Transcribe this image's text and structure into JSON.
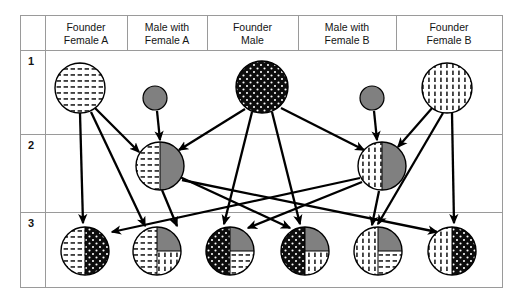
{
  "figure": {
    "type": "pedigree-breeding-diagram",
    "title": "",
    "generation_label_column_header": "",
    "column_headers": [
      {
        "id": "founder-female-a",
        "line1": "Founder",
        "line2": "Female A"
      },
      {
        "id": "male-with-female-a",
        "line1": "Male with",
        "line2": "Female A"
      },
      {
        "id": "founder-male",
        "line1": "Founder",
        "line2": "Male"
      },
      {
        "id": "male-with-female-b",
        "line1": "Male with",
        "line2": "Female B"
      },
      {
        "id": "founder-female-b",
        "line1": "Founder",
        "line2": "Female B"
      }
    ],
    "generation_labels": [
      "1",
      "2",
      "3"
    ],
    "colors": {
      "gray_fill": "#808080",
      "black_fill": "#0d0d0d",
      "white_fill": "#ffffff",
      "outline": "#000000",
      "grid": "#9a9a9a",
      "text": "#141414"
    },
    "pattern_legend": [
      {
        "id": "horizontal-dash",
        "meaning": "Founder Female A genome"
      },
      {
        "id": "vertical-dash",
        "meaning": "Founder Female B genome"
      },
      {
        "id": "black-dotted",
        "meaning": "Founder Male genome"
      },
      {
        "id": "solid-gray",
        "meaning": "Unrelated male genome"
      }
    ],
    "individuals": {
      "generation1": [
        {
          "id": "founder-female-a",
          "cx": 80,
          "cy": 88,
          "r": 25,
          "shape": "circle",
          "segments": [
            {
              "part": "full",
              "fill": "horizontal-dash"
            }
          ]
        },
        {
          "id": "male-with-female-a",
          "cx": 155,
          "cy": 98,
          "r": 12,
          "shape": "circle",
          "segments": [
            {
              "part": "full",
              "fill": "solid-gray"
            }
          ]
        },
        {
          "id": "founder-male",
          "cx": 262,
          "cy": 87,
          "r": 26,
          "shape": "circle",
          "segments": [
            {
              "part": "full",
              "fill": "black-dotted"
            }
          ]
        },
        {
          "id": "male-with-female-b",
          "cx": 372,
          "cy": 98,
          "r": 12,
          "shape": "circle",
          "segments": [
            {
              "part": "full",
              "fill": "solid-gray"
            }
          ]
        },
        {
          "id": "founder-female-b",
          "cx": 447,
          "cy": 88,
          "r": 25,
          "shape": "circle",
          "segments": [
            {
              "part": "full",
              "fill": "vertical-dash"
            }
          ]
        }
      ],
      "generation2": [
        {
          "id": "gen2-left",
          "cx": 160,
          "cy": 166,
          "r": 24,
          "shape": "circle",
          "segments": [
            {
              "part": "left-half",
              "fill": "horizontal-dash"
            },
            {
              "part": "right-half",
              "fill": "solid-gray"
            }
          ]
        },
        {
          "id": "gen2-right",
          "cx": 382,
          "cy": 166,
          "r": 24,
          "shape": "circle",
          "segments": [
            {
              "part": "left-half",
              "fill": "vertical-dash"
            },
            {
              "part": "right-half",
              "fill": "solid-gray"
            }
          ]
        }
      ],
      "generation3": [
        {
          "id": "gen3-1",
          "cx": 85,
          "cy": 251,
          "r": 24,
          "shape": "circle",
          "segments": [
            {
              "part": "left-half",
              "fill": "horizontal-dash"
            },
            {
              "part": "right-half",
              "fill": "black-dotted"
            }
          ]
        },
        {
          "id": "gen3-2",
          "cx": 157,
          "cy": 251,
          "r": 24,
          "shape": "circle",
          "segments": [
            {
              "part": "left-half",
              "fill": "horizontal-dash"
            },
            {
              "part": "top-right-quarter",
              "fill": "solid-gray"
            },
            {
              "part": "bottom-right-quarter",
              "fill": "vertical-dash"
            }
          ]
        },
        {
          "id": "gen3-3",
          "cx": 230,
          "cy": 251,
          "r": 24,
          "shape": "circle",
          "segments": [
            {
              "part": "left-half",
              "fill": "black-dotted"
            },
            {
              "part": "top-right-quarter",
              "fill": "solid-gray"
            },
            {
              "part": "bottom-right-quarter",
              "fill": "horizontal-dash"
            }
          ]
        },
        {
          "id": "gen3-4",
          "cx": 305,
          "cy": 251,
          "r": 24,
          "shape": "circle",
          "segments": [
            {
              "part": "left-half",
              "fill": "black-dotted"
            },
            {
              "part": "top-right-quarter",
              "fill": "solid-gray"
            },
            {
              "part": "bottom-right-quarter",
              "fill": "vertical-dash"
            }
          ]
        },
        {
          "id": "gen3-5",
          "cx": 378,
          "cy": 251,
          "r": 24,
          "shape": "circle",
          "segments": [
            {
              "part": "left-half",
              "fill": "vertical-dash"
            },
            {
              "part": "top-right-quarter",
              "fill": "solid-gray"
            },
            {
              "part": "bottom-right-quarter",
              "fill": "horizontal-dash"
            }
          ]
        },
        {
          "id": "gen3-6",
          "cx": 452,
          "cy": 251,
          "r": 24,
          "shape": "circle",
          "segments": [
            {
              "part": "left-half",
              "fill": "vertical-dash"
            },
            {
              "part": "right-half",
              "fill": "black-dotted"
            }
          ]
        }
      ]
    },
    "arrows": [
      {
        "from": "founder-female-a",
        "to": "gen2-left",
        "x1": 95,
        "y1": 108,
        "x2": 139,
        "y2": 152
      },
      {
        "from": "founder-female-a",
        "to": "gen3-1",
        "x1": 80,
        "y1": 113,
        "x2": 83,
        "y2": 223
      },
      {
        "from": "founder-female-a",
        "to": "gen3-2",
        "x1": 91,
        "y1": 112,
        "x2": 145,
        "y2": 226
      },
      {
        "from": "male-with-female-a",
        "to": "gen2-left",
        "x1": 157,
        "y1": 111,
        "x2": 160,
        "y2": 140
      },
      {
        "from": "founder-male",
        "to": "gen2-left",
        "x1": 245,
        "y1": 109,
        "x2": 179,
        "y2": 150
      },
      {
        "from": "founder-male",
        "to": "gen3-3",
        "x1": 252,
        "y1": 112,
        "x2": 224,
        "y2": 224
      },
      {
        "from": "founder-male",
        "to": "gen3-4",
        "x1": 272,
        "y1": 112,
        "x2": 300,
        "y2": 224
      },
      {
        "from": "founder-male",
        "to": "gen2-right",
        "x1": 281,
        "y1": 108,
        "x2": 364,
        "y2": 150
      },
      {
        "from": "male-with-female-b",
        "to": "gen2-right",
        "x1": 374,
        "y1": 111,
        "x2": 377,
        "y2": 140
      },
      {
        "from": "founder-female-b",
        "to": "gen2-right",
        "x1": 433,
        "y1": 107,
        "x2": 398,
        "y2": 147
      },
      {
        "from": "founder-female-b",
        "to": "gen3-5",
        "x1": 443,
        "y1": 113,
        "x2": 378,
        "y2": 224
      },
      {
        "from": "founder-female-b",
        "to": "gen3-6",
        "x1": 452,
        "y1": 113,
        "x2": 454,
        "y2": 223
      },
      {
        "from": "gen2-left",
        "to": "gen3-2",
        "x1": 162,
        "y1": 190,
        "x2": 177,
        "y2": 226
      },
      {
        "from": "gen2-left",
        "to": "gen3-4",
        "x1": 180,
        "y1": 177,
        "x2": 290,
        "y2": 228
      },
      {
        "from": "gen2-left",
        "to": "gen3-6",
        "x1": 182,
        "y1": 180,
        "x2": 437,
        "y2": 232
      },
      {
        "from": "gen2-right",
        "to": "gen3-1",
        "x1": 360,
        "y1": 178,
        "x2": 112,
        "y2": 232
      },
      {
        "from": "gen2-right",
        "to": "gen3-3",
        "x1": 362,
        "y1": 182,
        "x2": 248,
        "y2": 228
      },
      {
        "from": "gen2-right",
        "to": "gen3-5",
        "x1": 379,
        "y1": 191,
        "x2": 372,
        "y2": 225
      }
    ]
  }
}
